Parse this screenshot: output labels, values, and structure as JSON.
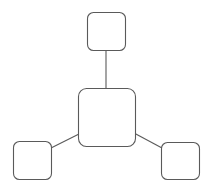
{
  "diagram": {
    "type": "hub-and-spoke",
    "canvas": {
      "width": 208,
      "height": 188,
      "background": "#ffffff"
    },
    "colors": {
      "stroke": "#5a5a5a",
      "fill": "#ffffff"
    },
    "nodes": [
      {
        "id": "center",
        "label": "",
        "x": 78,
        "y": 88,
        "w": 57,
        "h": 58,
        "r": 8
      },
      {
        "id": "top",
        "label": "",
        "x": 87,
        "y": 12,
        "w": 38,
        "h": 38,
        "r": 6
      },
      {
        "id": "bottom-left",
        "label": "",
        "x": 13,
        "y": 141,
        "w": 38,
        "h": 38,
        "r": 6
      },
      {
        "id": "bottom-right",
        "label": "",
        "x": 161,
        "y": 142,
        "w": 38,
        "h": 37,
        "r": 6
      }
    ],
    "edges": [
      {
        "from": "center",
        "to": "top",
        "x1": 106,
        "y1": 88,
        "x2": 106,
        "y2": 50
      },
      {
        "from": "center",
        "to": "bottom-left",
        "x1": 79,
        "y1": 134,
        "x2": 51,
        "y2": 148
      },
      {
        "from": "center",
        "to": "bottom-right",
        "x1": 134,
        "y1": 133,
        "x2": 162,
        "y2": 148
      }
    ]
  }
}
